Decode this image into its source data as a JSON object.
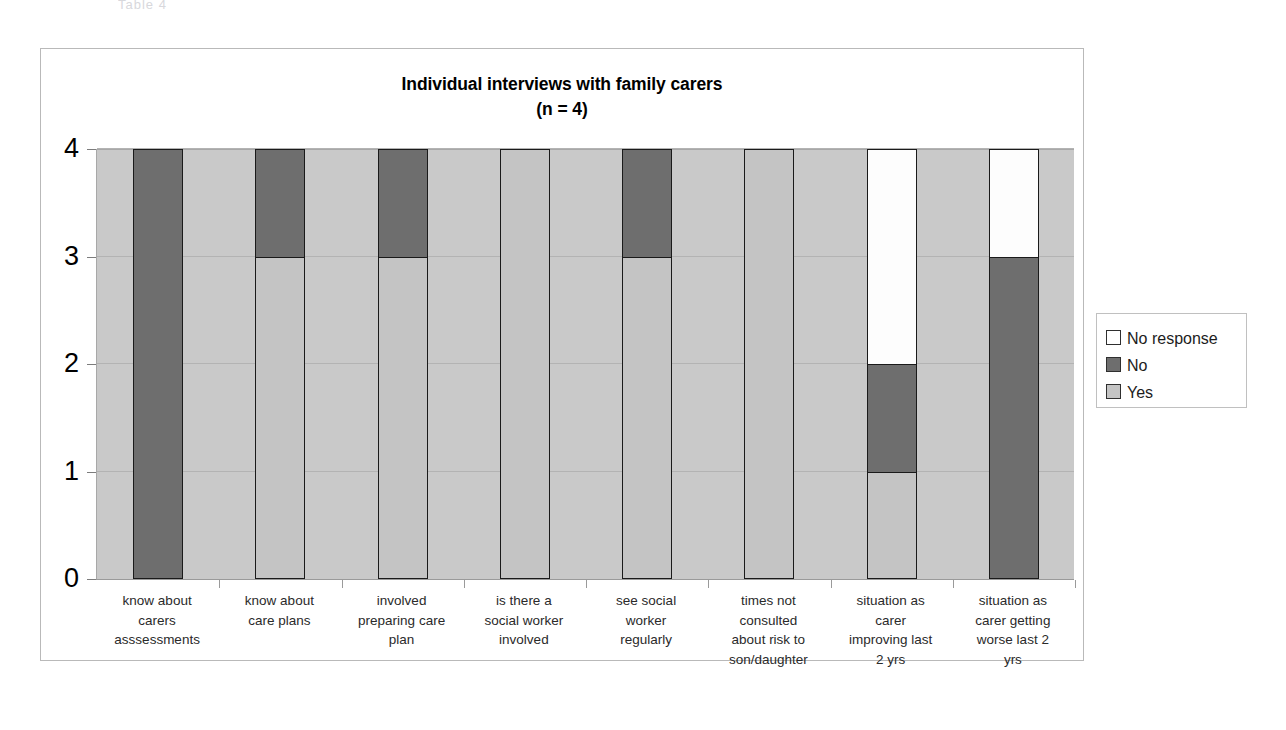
{
  "page": {
    "top_fragment": "Table 4"
  },
  "chart_data": {
    "type": "bar",
    "stacked": true,
    "title": "Individual interviews with family carers",
    "subtitle": "(n = 4)",
    "xlabel": "",
    "ylabel": "",
    "ylim": [
      0,
      4
    ],
    "yticks": [
      "0",
      "1",
      "2",
      "3",
      "4"
    ],
    "grid": true,
    "legend_position": "right",
    "categories": [
      "know about carers asssessments",
      "know about care plans",
      "involved preparing care plan",
      "is there a social worker involved",
      "see social worker regularly",
      "times not consulted about risk to son/daughter",
      "situation as carer improving last 2 yrs",
      "situation as carer getting worse last 2 yrs"
    ],
    "category_lines": [
      [
        "know about",
        "carers",
        "asssessments"
      ],
      [
        "know about",
        "care plans"
      ],
      [
        "involved",
        "preparing care",
        "plan"
      ],
      [
        "is there a",
        "social worker",
        "involved"
      ],
      [
        "see social",
        "worker",
        "regularly"
      ],
      [
        "times not",
        "consulted",
        "about risk to",
        "son/daughter"
      ],
      [
        "situation as",
        "carer",
        "improving last",
        "2 yrs"
      ],
      [
        "situation as",
        "carer getting",
        "worse last 2",
        "yrs"
      ]
    ],
    "series": [
      {
        "name": "Yes",
        "color": "#c4c4c4",
        "values": [
          0,
          3,
          3,
          4,
          3,
          4,
          1,
          0
        ]
      },
      {
        "name": "No",
        "color": "#6e6e6e",
        "values": [
          4,
          1,
          1,
          0,
          1,
          0,
          1,
          3
        ]
      },
      {
        "name": "No response",
        "color": "#ffffff",
        "values": [
          0,
          0,
          0,
          0,
          0,
          0,
          2,
          1
        ]
      }
    ],
    "legend": [
      {
        "label": "No response",
        "color": "#ffffff"
      },
      {
        "label": "No",
        "color": "#6e6e6e"
      },
      {
        "label": "Yes",
        "color": "#c4c4c4"
      }
    ]
  }
}
